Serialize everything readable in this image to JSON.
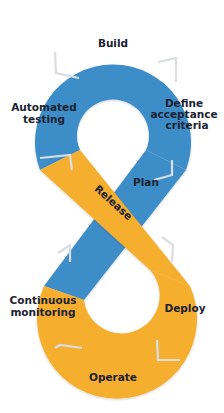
{
  "diagram": {
    "colors": {
      "top_loop": "#3d8dc8",
      "bottom_loop": "#f5ae2e",
      "divider": "#d9dde2",
      "text": "#1b2230",
      "background": "#ffffff"
    },
    "top_loop": {
      "stages": [
        {
          "id": "build",
          "label_lines": [
            "Build"
          ]
        },
        {
          "id": "define-acceptance-criteria",
          "label_lines": [
            "Define",
            "acceptance",
            "criteria"
          ]
        },
        {
          "id": "plan",
          "label_lines": [
            "Plan"
          ]
        },
        {
          "id": "automated-testing",
          "label_lines": [
            "Automated",
            "testing"
          ]
        }
      ]
    },
    "bottom_loop": {
      "stages": [
        {
          "id": "release",
          "label_lines": [
            "Release"
          ]
        },
        {
          "id": "deploy",
          "label_lines": [
            "Deploy"
          ]
        },
        {
          "id": "operate",
          "label_lines": [
            "Operate"
          ]
        },
        {
          "id": "continuous-monitoring",
          "label_lines": [
            "Continuous",
            "monitoring"
          ]
        }
      ]
    }
  }
}
